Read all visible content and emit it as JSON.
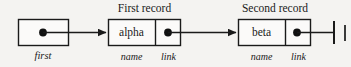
{
  "figure": {
    "kind": "linked-list-diagram",
    "background_color": "#f4f3f1",
    "stroke_color": "#1a1a1a"
  },
  "pointer_variable": {
    "name_label": "first",
    "box_name": "first-pointer-box",
    "dot_icon": "pointer-dot-icon",
    "arrow_icon": "arrow-right-icon"
  },
  "records": [
    {
      "caption": "First record",
      "name_value": "alpha",
      "name_field_label": "name",
      "link_field_label": "link",
      "link_dot_icon": "pointer-dot-icon",
      "arrow_icon": "arrow-right-icon"
    },
    {
      "caption": "Second record",
      "name_value": "beta",
      "name_field_label": "name",
      "link_field_label": "link",
      "link_dot_icon": "pointer-dot-icon",
      "terminator_icon": "null-terminator-icon"
    }
  ]
}
